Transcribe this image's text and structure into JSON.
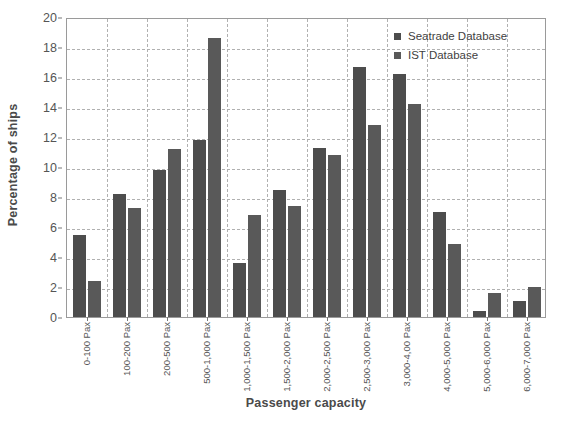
{
  "chart_data": {
    "type": "bar",
    "title": "",
    "xlabel": "Passenger capacity",
    "ylabel": "Percentage of ships",
    "ylim": [
      0,
      20
    ],
    "ytick_step": 2,
    "yticks": [
      0,
      2,
      4,
      6,
      8,
      10,
      12,
      14,
      16,
      18,
      20
    ],
    "grid": true,
    "legend_position": "top-right",
    "categories": [
      "0-100 Pax",
      "100-200 Pax",
      "200-500 Pax",
      "500-1,000 Pax",
      "1,000-1,500 Pax",
      "1,500-2,000 Pax",
      "2,000-2,500 Pax",
      "2,500-3,000 Pax",
      "3,000-4,00 Pax",
      "4,000-5,000 Pax",
      "5,000-6,000 Pax",
      "6,000-7,000 Pax"
    ],
    "series": [
      {
        "name": "Seatrade Database",
        "color": "#4d4d4d",
        "values": [
          5.5,
          8.2,
          9.8,
          11.8,
          3.6,
          8.5,
          11.3,
          16.7,
          16.2,
          7.0,
          0.4,
          1.1
        ]
      },
      {
        "name": "IST Database",
        "color": "#595959",
        "values": [
          2.4,
          7.3,
          11.2,
          18.6,
          6.8,
          7.4,
          10.8,
          12.8,
          14.2,
          4.9,
          1.6,
          2.0
        ]
      }
    ]
  },
  "legend": {
    "items": [
      {
        "label": "Seatrade Database"
      },
      {
        "label": "IST Database"
      }
    ]
  }
}
